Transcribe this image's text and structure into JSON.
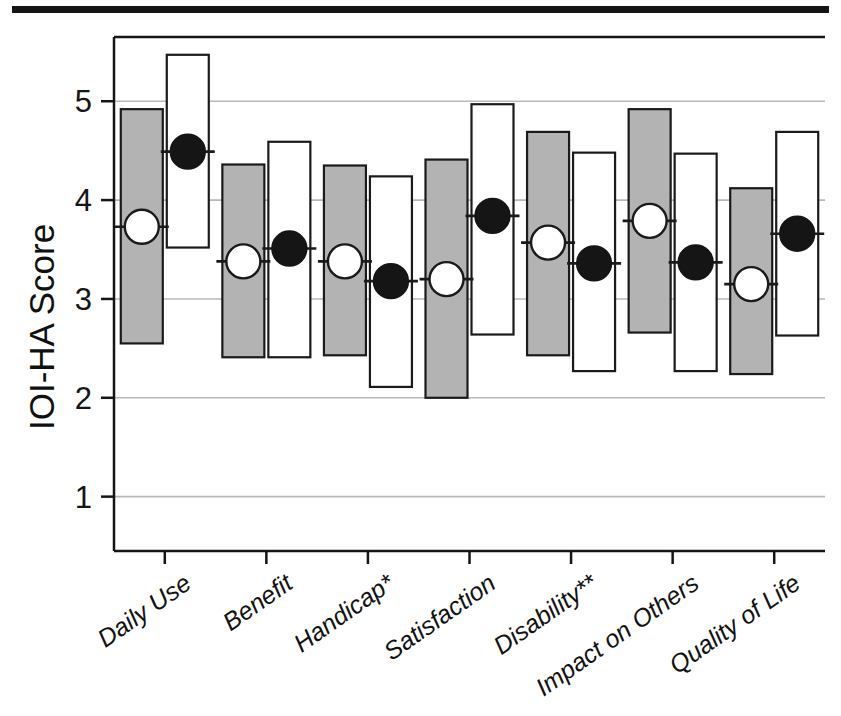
{
  "figure": {
    "top_rule_color": "#151515"
  },
  "axis": {
    "y_title": "IOI-HA Score",
    "y_ticks": [
      "1",
      "2",
      "3",
      "4",
      "5"
    ]
  },
  "categories": [
    "Daily Use",
    "Benefit*",
    "Handicap*",
    "Satisfaction",
    "Disability**",
    "Impact on Others",
    "Quality of Life"
  ],
  "category_labels": [
    "Daily Use",
    "Benefit",
    "Handicap*",
    "Satisfaction",
    "Disability**",
    "Impact on Others",
    "Quality of Life"
  ],
  "legend": {
    "series_1_name": "Group 1 (gray box, open circle median)",
    "series_2_name": "Group 2 (white box, filled circle median)",
    "series_1_fill": "#b3b3b3",
    "series_2_fill": "#ffffff",
    "marker_1": "open-circle",
    "marker_2": "filled-circle"
  },
  "chart_data": {
    "type": "bar",
    "title": "",
    "subtitle": "",
    "xlabel": "",
    "ylabel": "IOI-HA Score",
    "ylim": [
      0.45,
      5.65
    ],
    "yticks": [
      1,
      2,
      3,
      4,
      5
    ],
    "grid": "horizontal",
    "legend_position": "none",
    "categories": [
      "Daily Use",
      "Benefit",
      "Handicap*",
      "Satisfaction",
      "Disability**",
      "Impact on Others",
      "Quality of Life"
    ],
    "series": [
      {
        "name": "Series 1 (gray)",
        "fill": "#b3b3b3",
        "marker": "open-circle",
        "low": [
          2.55,
          2.41,
          2.43,
          2.0,
          2.43,
          2.66,
          2.24
        ],
        "high": [
          4.92,
          4.36,
          4.35,
          4.41,
          4.69,
          4.92,
          4.12
        ],
        "median": [
          3.73,
          3.38,
          3.38,
          3.2,
          3.57,
          3.79,
          3.15
        ]
      },
      {
        "name": "Series 2 (white)",
        "fill": "#ffffff",
        "marker": "filled-circle",
        "low": [
          3.52,
          2.41,
          2.11,
          2.64,
          2.27,
          2.27,
          2.63
        ],
        "high": [
          5.47,
          4.59,
          4.24,
          4.97,
          4.48,
          4.47,
          4.69
        ],
        "median": [
          4.49,
          3.51,
          3.18,
          3.84,
          3.36,
          3.37,
          3.66
        ]
      }
    ]
  }
}
